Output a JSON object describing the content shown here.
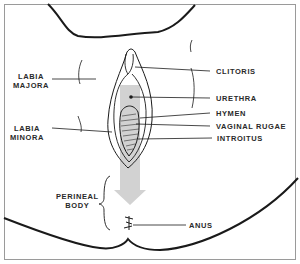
{
  "diagram": {
    "type": "anatomical line drawing",
    "labels": {
      "labia_majora_1": "LABIA",
      "labia_majora_2": "MAJORA",
      "labia_minora_1": "LABIA",
      "labia_minora_2": "MINORA",
      "clitoris": "CLITORIS",
      "urethra": "URETHRA",
      "hymen": "HYMEN",
      "vaginal_rugae": "VAGINAL RUGAE",
      "introitus": "INTROITUS",
      "perineal_body_1": "PERINEAL",
      "perineal_body_2": "BODY",
      "anus": "ANUS"
    },
    "colors": {
      "line": "#1a1a1a",
      "arrow_fill": "#cfcfcf",
      "frame": "#9a9a9a"
    }
  }
}
